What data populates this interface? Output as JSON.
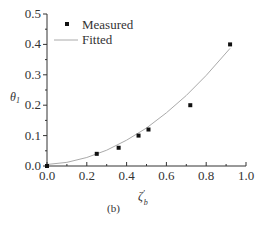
{
  "chart_data": {
    "type": "scatter",
    "title": "",
    "caption": "(b)",
    "xlabel": "ζ'_b",
    "xlabel_main": "ζ",
    "xlabel_sup": "'",
    "xlabel_sub": "b",
    "ylabel": "θ1",
    "ylabel_main": "θ",
    "ylabel_sub": "1",
    "xlim": [
      0.0,
      1.0
    ],
    "ylim": [
      0.0,
      0.5
    ],
    "xticks": [
      "0.0",
      "0.2",
      "0.4",
      "0.6",
      "0.8",
      "1.0"
    ],
    "yticks": [
      "0.0",
      "0.1",
      "0.2",
      "0.3",
      "0.4",
      "0.5"
    ],
    "grid": false,
    "legend_position": "upper left",
    "series": [
      {
        "name": "Measured",
        "type": "scatter",
        "marker": "square",
        "color": "#111111",
        "x": [
          0.0,
          0.25,
          0.36,
          0.46,
          0.51,
          0.72,
          0.92
        ],
        "y": [
          0.0,
          0.04,
          0.06,
          0.1,
          0.12,
          0.2,
          0.4
        ]
      },
      {
        "name": "Fitted",
        "type": "line",
        "color": "#aaaaaa",
        "x": [
          0.0,
          0.1,
          0.2,
          0.3,
          0.4,
          0.5,
          0.6,
          0.7,
          0.8,
          0.92
        ],
        "y": [
          0.005,
          0.012,
          0.028,
          0.052,
          0.085,
          0.125,
          0.175,
          0.232,
          0.298,
          0.387
        ]
      }
    ]
  }
}
